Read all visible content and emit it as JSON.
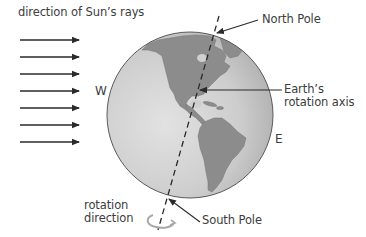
{
  "diagram": {
    "type": "earth-rotation-axis",
    "labels": {
      "sun_rays": "direction of Sun’s rays",
      "north_pole": "North Pole",
      "south_pole": "South Pole",
      "axis_line1": "Earth’s",
      "axis_line2": "rotation axis",
      "west": "W",
      "east": "E",
      "rotation_line1": "rotation",
      "rotation_line2": "direction"
    },
    "sun_ray_arrows": {
      "count": 7,
      "x_start": 20,
      "x_end": 79,
      "y_positions": [
        40,
        57,
        74,
        91,
        108,
        125,
        142
      ]
    },
    "globe": {
      "center_x": 190,
      "center_y": 115,
      "radius": 83,
      "ocean_color": "#c9c9c9",
      "ocean_highlight": "#e0e0e0",
      "land_color": "#8c8c8c",
      "outline_color": "#5a5a5a",
      "visible_continents": [
        "North America",
        "Central America",
        "South America",
        "Greenland",
        "Caribbean islands"
      ]
    },
    "axis": {
      "style": "dashed",
      "top": [
        219,
        16
      ],
      "bottom": [
        158,
        230
      ],
      "color": "#2a2a2a"
    },
    "colors": {
      "text": "#3c3c3c",
      "arrow": "#2a2a2a",
      "rotation_glyph": "#a8a8a8"
    }
  }
}
